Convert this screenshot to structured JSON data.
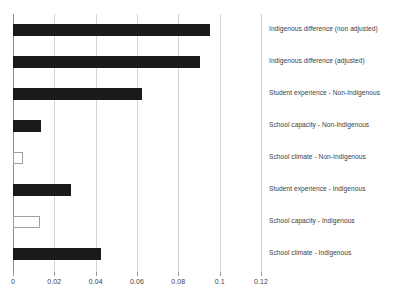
{
  "chart_data": {
    "type": "bar",
    "orientation": "horizontal",
    "title": "",
    "xlabel": "",
    "ylabel": "",
    "xlim": [
      0,
      0.12
    ],
    "grid": true,
    "legend": "none",
    "xticks": [
      "0",
      "0.02",
      "0.04",
      "0.06",
      "0.08",
      "0.1",
      "0.12"
    ],
    "xtick_values": [
      0,
      0.02,
      0.04,
      0.06,
      0.08,
      0.1,
      0.12
    ],
    "categories": [
      "Indigenous difference (non adjusted)",
      "Indigenous difference (adjusted)",
      "Student experience - Non-Indigenous",
      "School capacity - Non-Indigenous",
      "School climate - Non-Indigenous",
      "Student experience - Indigenous",
      "School capacity - Indigenous",
      "School climate - Indigenous"
    ],
    "values": [
      0.0955,
      0.0905,
      0.0625,
      0.0137,
      0.005,
      0.0282,
      0.0132,
      0.0428
    ],
    "bar_styles": [
      "filled",
      "filled",
      "filled",
      "filled",
      "hollow",
      "filled",
      "hollow",
      "filled"
    ]
  },
  "colors": {
    "bar_filled": "#1a1a1a",
    "bar_hollow_fill": "#ffffff",
    "bar_hollow_border": "#a0a0a0",
    "gridline": "#d4d4d4",
    "axis": "#8c8c8c",
    "text": "#3d3d3d",
    "background": "#ffffff"
  }
}
